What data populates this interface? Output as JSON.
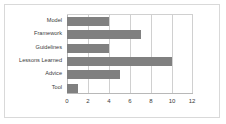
{
  "chart_data": {
    "type": "bar",
    "orientation": "horizontal",
    "title": "",
    "xlabel": "",
    "ylabel": "",
    "categories": [
      "Model",
      "Framework",
      "Guidelines",
      "Lessons Learned",
      "Advice",
      "Tool"
    ],
    "values": [
      4,
      7,
      4,
      10,
      5,
      1
    ],
    "xlim": [
      0,
      12
    ],
    "xticks": [
      "0",
      "2",
      "4",
      "6",
      "8",
      "10",
      "12"
    ],
    "xtick_values": [
      0,
      2,
      4,
      6,
      8,
      10,
      12
    ],
    "grid": "vertical",
    "legend": "none",
    "series": [
      {
        "name": "",
        "values": [
          4,
          7,
          4,
          10,
          5,
          1
        ]
      }
    ]
  },
  "style": {
    "bar_color": "#808080",
    "grid_color": "#d0d0d0",
    "axis_color": "#b8b8b8",
    "frame_color": "#d9d9d9",
    "text_color": "#3a3a3a",
    "background": "#ffffff"
  }
}
